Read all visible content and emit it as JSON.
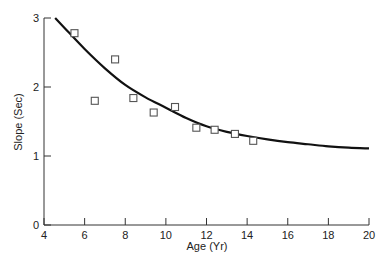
{
  "chart_data": {
    "type": "scatter",
    "title": "",
    "xlabel": "Age (Yr)",
    "ylabel": "Slope (Sec)",
    "xlim": [
      4,
      20
    ],
    "ylim": [
      0,
      3
    ],
    "xticks": [
      4,
      6,
      8,
      10,
      12,
      14,
      16,
      18,
      20
    ],
    "yticks": [
      0,
      1,
      2,
      3
    ],
    "grid": false,
    "legend": null,
    "series": [
      {
        "name": "observed",
        "type": "scatter",
        "marker": "open-square",
        "x": [
          5.5,
          6.5,
          7.5,
          8.4,
          9.4,
          10.45,
          11.5,
          12.4,
          13.4,
          14.3
        ],
        "y": [
          2.78,
          1.8,
          2.4,
          1.84,
          1.63,
          1.71,
          1.41,
          1.38,
          1.32,
          1.22
        ]
      },
      {
        "name": "fitted curve",
        "type": "line",
        "x": [
          4.55,
          5,
          6,
          7,
          8,
          9,
          10,
          11,
          12,
          13,
          14,
          15,
          16,
          17,
          18,
          19,
          20
        ],
        "y": [
          3.0,
          2.86,
          2.55,
          2.27,
          2.03,
          1.85,
          1.7,
          1.55,
          1.43,
          1.35,
          1.29,
          1.24,
          1.2,
          1.17,
          1.14,
          1.12,
          1.11
        ]
      }
    ]
  },
  "colors": {
    "axis": "#333333",
    "curve": "#111111",
    "marker": "#555555"
  }
}
